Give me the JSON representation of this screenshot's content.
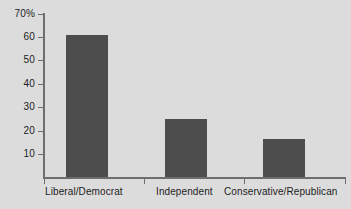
{
  "chart_data": {
    "type": "bar",
    "title": "",
    "subtitle": "",
    "xlabel": "",
    "ylabel": "",
    "categories": [
      "Liberal/Democrat",
      "Independent",
      "Conservative/Republican"
    ],
    "values": [
      61,
      25,
      16.5
    ],
    "ylim": [
      0,
      70
    ],
    "ytick_labels": [
      "70%",
      "60",
      "50",
      "40",
      "30",
      "20",
      "10"
    ],
    "ytick_values": [
      70,
      60,
      50,
      40,
      30,
      20,
      10
    ],
    "grid": false,
    "legend": null,
    "bar_color": "#4d4d4d",
    "background_color": "#dcdcdc",
    "axis_color": "#6e6e6e",
    "text_color": "#1c1c1c"
  }
}
